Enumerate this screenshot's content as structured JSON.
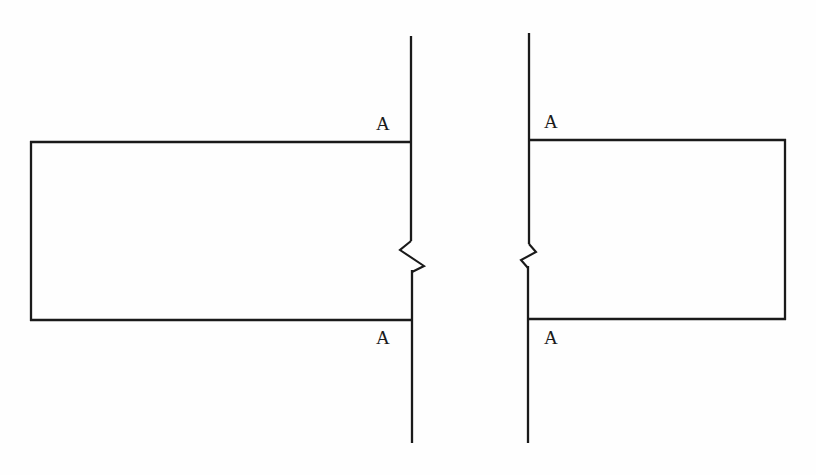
{
  "drawing": {
    "background_color": "#fefefe",
    "line_color": "#1a1a1a",
    "title": "",
    "canvas": {
      "width": 816,
      "height": 475
    }
  },
  "labels": {
    "left_top": "A",
    "left_bottom": "A",
    "right_top": "A",
    "right_bottom": "A"
  },
  "geometry": {
    "left_part": {
      "name": "left-part-outline",
      "left_x": 30,
      "right_x": 411,
      "top_y": 142,
      "bottom_y": 320
    },
    "right_part": {
      "name": "right-part-outline",
      "left_x": 528,
      "right_x": 785,
      "top_y": 140,
      "bottom_y": 319
    },
    "left_section_line": {
      "name": "left-cutting-plane-line",
      "x": 411,
      "top_y": 36,
      "bottom_y": 443,
      "break_top_y": 240,
      "break_bottom_y": 272
    },
    "right_section_line": {
      "name": "right-cutting-plane-line",
      "x": 528,
      "top_y": 33,
      "bottom_y": 443,
      "break_top_y": 243,
      "break_bottom_y": 268
    }
  }
}
